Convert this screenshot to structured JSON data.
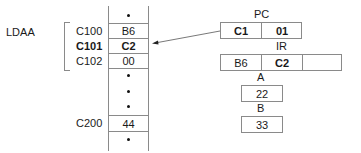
{
  "instruction": {
    "mnemonic": "LDAA"
  },
  "memory": {
    "rows": [
      {
        "address": "",
        "value": "•",
        "kind": "ellipsis"
      },
      {
        "address": "C100",
        "value": "B6",
        "kind": "data",
        "bold": false
      },
      {
        "address": "C101",
        "value": "C2",
        "kind": "data",
        "bold": true
      },
      {
        "address": "C102",
        "value": "00",
        "kind": "data",
        "bold": false
      },
      {
        "address": "",
        "value": "•",
        "kind": "ellipsis"
      },
      {
        "address": "",
        "value": "•",
        "kind": "ellipsis"
      },
      {
        "address": "",
        "value": "•",
        "kind": "ellipsis"
      },
      {
        "address": "C200",
        "value": "44",
        "kind": "data",
        "bold": false
      },
      {
        "address": "",
        "value": "•",
        "kind": "ellipsis"
      }
    ],
    "addr_c100": "C100",
    "addr_c101": "C101",
    "addr_c102": "C102",
    "addr_c200": "C200",
    "val_c100": "B6",
    "val_c101": "C2",
    "val_c102": "00",
    "val_c200": "44"
  },
  "registers": {
    "pc": {
      "label": "PC",
      "high": "C1",
      "low": "01"
    },
    "ir": {
      "label": "IR",
      "byte1": "B6",
      "byte2": "C2",
      "byte3": ""
    },
    "a": {
      "label": "A",
      "value": "22"
    },
    "b": {
      "label": "B",
      "value": "33"
    }
  },
  "arrow": {
    "from": "PC",
    "to": "C101",
    "meaning": "PC points to address C101"
  },
  "colors": {
    "line": "#8a8a8a",
    "text": "#1a1a1a",
    "background": "#ffffff"
  }
}
